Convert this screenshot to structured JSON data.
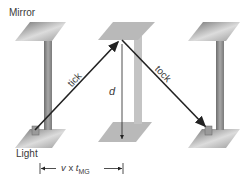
{
  "labels": {
    "mirror": "Mirror",
    "light": "Light",
    "tick": "tick",
    "tock": "tock",
    "distance": "d",
    "base_v": "v",
    "base_times": " x ",
    "base_t": "t",
    "base_sub": "MG"
  },
  "colors": {
    "path": "#222222",
    "plate_dark": "#8a8a8a",
    "plate_light": "#d6d6d6",
    "faded_plate": "#b9b9b9",
    "post": "#8f8f8f",
    "faded_post": "#c4c4c4"
  }
}
